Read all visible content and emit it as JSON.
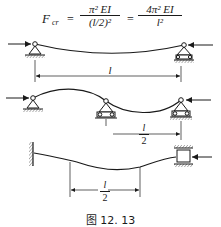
{
  "formula": {
    "lhs": "F",
    "lhs_sub": "cr",
    "eq1": "=",
    "frac1_num": "π² EI",
    "frac1_den": "(l/2)²",
    "eq2": "=",
    "frac2_num": "4π² EI",
    "frac2_den": "l²"
  },
  "diagram1": {
    "description": "Pinned-pinned column, single half-wave buckling",
    "span_label": "l"
  },
  "diagram2": {
    "description": "Column with intermediate support, two half-waves",
    "span_label_num": "l",
    "span_label_den": "2"
  },
  "diagram3": {
    "description": "Fixed-guided column, equivalent length",
    "span_label_num": "l",
    "span_label_den": "2"
  },
  "caption": "图 12. 13",
  "colors": {
    "ink": "#1a1a1a",
    "background": "#ffffff"
  }
}
